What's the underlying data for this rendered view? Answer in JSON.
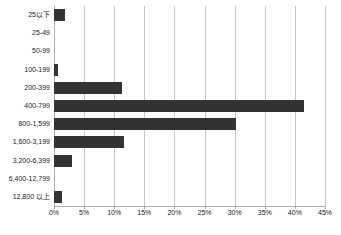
{
  "chart_data": {
    "type": "bar",
    "orientation": "horizontal",
    "title": "",
    "xlabel": "",
    "ylabel": "",
    "categories": [
      "25以下",
      "25-49",
      "50-99",
      "100-199",
      "200-399",
      "400-799",
      "800-1,599",
      "1,600-3,199",
      "3,200-6,399",
      "6,400-12,799",
      "12,800 以上"
    ],
    "values": [
      1.9,
      0,
      0,
      0.7,
      11.3,
      41.5,
      30.3,
      11.7,
      3.0,
      0,
      1.3
    ],
    "value_unit": "%",
    "xlim": [
      0,
      45
    ],
    "xticks": [
      0,
      5,
      10,
      15,
      20,
      25,
      30,
      35,
      40,
      45
    ],
    "xtick_labels": [
      "0%",
      "5%",
      "10%",
      "15%",
      "20%",
      "25%",
      "30%",
      "35%",
      "40%",
      "45%"
    ],
    "grid": true,
    "grid_axis": "x",
    "legend": false,
    "legend_position": "none",
    "bar_color": "#333333",
    "gridline_color": "#c9c9c9",
    "background_color": "#ffffff",
    "axis_color": "#b0b0b0"
  }
}
